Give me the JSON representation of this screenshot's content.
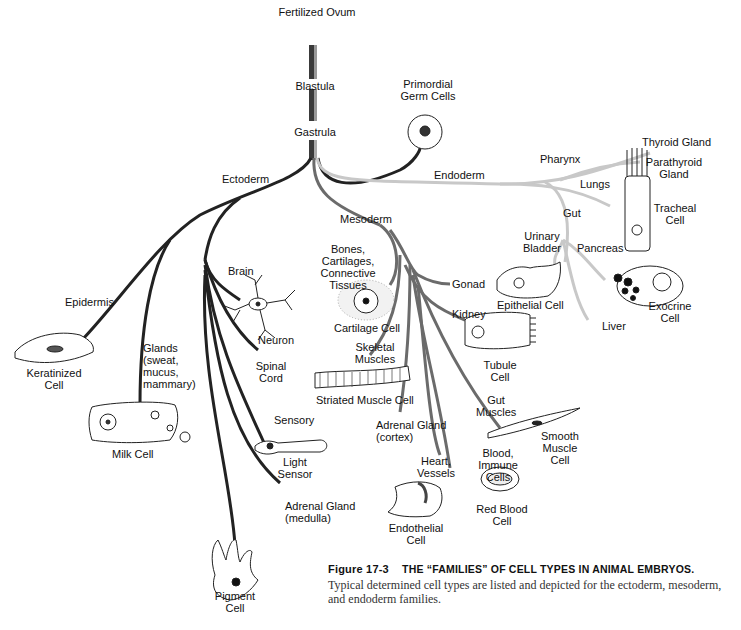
{
  "figure": {
    "number": "Figure 17-3",
    "title": "THE “FAMILIES” OF CELL TYPES IN ANIMAL EMBRYOS.",
    "caption": "Typical determined cell types are listed and depicted for the ectoderm, mesoderm, and endoderm families."
  },
  "colors": {
    "trunk": "#333333",
    "ectoderm": "#222222",
    "mesoderm": "#6b6b6b",
    "endoderm": "#c4c4c4",
    "germ": "#222222",
    "text": "#111111"
  },
  "stages": {
    "fertilized_ovum": "Fertilized Ovum",
    "blastula": "Blastula",
    "gastrula": "Gastrula",
    "primordial_germ_cells": "Primordial\nGerm Cells"
  },
  "ectoderm": {
    "label": "Ectoderm",
    "branches": {
      "epidermis": "Epidermis",
      "keratinized_cell": "Keratinized\nCell",
      "glands": "Glands\n(sweat,\nmucus,\nmammary)",
      "milk_cell": "Milk Cell",
      "brain": "Brain",
      "neuron": "Neuron",
      "spinal_cord": "Spinal\nCord",
      "sensory": "Sensory",
      "light_sensor": "Light\nSensor",
      "adrenal_medulla": "Adrenal Gland\n(medulla)",
      "pigment_cell": "Pigment\nCell"
    }
  },
  "mesoderm": {
    "label": "Mesoderm",
    "branches": {
      "bones": "Bones,\nCartilages,\nConnective\nTissues",
      "cartilage_cell": "Cartilage Cell",
      "gonad": "Gonad",
      "kidney": "Kidney",
      "tubule_cell": "Tubule\nCell",
      "skeletal_muscles": "Skeletal\nMuscles",
      "striated_muscle_cell": "Striated Muscle Cell",
      "adrenal_cortex": "Adrenal Gland\n(cortex)",
      "gut_muscles": "Gut\nMuscles",
      "smooth_muscle_cell": "Smooth\nMuscle\nCell",
      "heart_vessels": "Heart,\nVessels",
      "endothelial_cell": "Endothelial\nCell",
      "blood_immune": "Blood,\nImmune\nCells",
      "red_blood_cell": "Red Blood\nCell"
    }
  },
  "endoderm": {
    "label": "Endoderm",
    "branches": {
      "pharynx": "Pharynx",
      "thyroid": "Thyroid Gland",
      "parathyroid": "Parathyroid\nGland",
      "lungs": "Lungs",
      "tracheal_cell": "Tracheal\nCell",
      "gut": "Gut",
      "urinary_bladder": "Urinary\nBladder",
      "epithelial_cell": "Epithelial Cell",
      "pancreas": "Pancreas",
      "exocrine_cell": "Exocrine\nCell",
      "liver": "Liver"
    }
  }
}
